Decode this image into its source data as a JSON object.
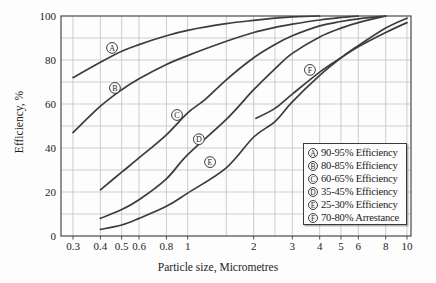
{
  "figure": {
    "kind": "filter-efficiency-chart"
  },
  "chart_data": {
    "type": "line",
    "title": "",
    "xlabel": "Particle size, Micrometres",
    "ylabel": "Efficiency, %",
    "x_scale": "log",
    "x_range": [
      0.3,
      10
    ],
    "ylim": [
      0,
      100
    ],
    "grid": true,
    "x_ticks": {
      "values": [
        0.3,
        0.4,
        0.5,
        0.6,
        0.8,
        1,
        2,
        3,
        4,
        5,
        6,
        8,
        10
      ],
      "labels": [
        "0.3",
        "0.4",
        "0.5",
        "0.6",
        "0.8",
        "1",
        "2",
        "3",
        "4",
        "5",
        "6",
        "8",
        "10"
      ]
    },
    "x_minor_gridlines": [
      1.5,
      2.5
    ],
    "y_ticks": {
      "values": [
        0,
        20,
        40,
        60,
        80,
        100
      ],
      "labels": [
        "0",
        "20",
        "40",
        "60",
        "80",
        "100"
      ]
    },
    "y_grid_step": 10,
    "line_color": "#3c3c3c",
    "grid_color": "#c0c0c0",
    "frame_color": "#4a4a4a",
    "series": [
      {
        "name": "A",
        "legend": "90-95% Efficiency",
        "points": [
          [
            0.3,
            72
          ],
          [
            0.4,
            79
          ],
          [
            0.5,
            84
          ],
          [
            0.6,
            87
          ],
          [
            0.8,
            91
          ],
          [
            1,
            93.5
          ],
          [
            1.5,
            96.5
          ],
          [
            2,
            98
          ],
          [
            2.5,
            99
          ],
          [
            3,
            99.6
          ],
          [
            4,
            100
          ]
        ]
      },
      {
        "name": "B",
        "legend": "80-85% Efficiency",
        "points": [
          [
            0.3,
            47
          ],
          [
            0.4,
            59
          ],
          [
            0.5,
            66.5
          ],
          [
            0.6,
            71.5
          ],
          [
            0.8,
            78
          ],
          [
            1,
            82
          ],
          [
            1.5,
            88.5
          ],
          [
            2,
            92.5
          ],
          [
            2.5,
            94.8
          ],
          [
            3,
            96.3
          ],
          [
            4,
            98.2
          ],
          [
            5,
            99.3
          ],
          [
            6,
            100
          ]
        ]
      },
      {
        "name": "C",
        "legend": "60-65% Efficiency",
        "points": [
          [
            0.4,
            21
          ],
          [
            0.5,
            29
          ],
          [
            0.6,
            35.5
          ],
          [
            0.8,
            46
          ],
          [
            1,
            56
          ],
          [
            1.2,
            62
          ],
          [
            1.5,
            71
          ],
          [
            2,
            81
          ],
          [
            2.5,
            87
          ],
          [
            3,
            91
          ],
          [
            4,
            95.5
          ],
          [
            5,
            97.5
          ],
          [
            6,
            98.7
          ],
          [
            8,
            100
          ]
        ]
      },
      {
        "name": "D",
        "legend": "35-45% Efficiency",
        "points": [
          [
            0.4,
            8
          ],
          [
            0.5,
            12
          ],
          [
            0.6,
            16.5
          ],
          [
            0.8,
            26
          ],
          [
            1,
            37
          ],
          [
            1.5,
            53
          ],
          [
            2,
            66.5
          ],
          [
            2.5,
            76
          ],
          [
            3,
            83
          ],
          [
            4,
            90.5
          ],
          [
            5,
            94.5
          ],
          [
            6,
            97
          ],
          [
            8,
            100
          ]
        ]
      },
      {
        "name": "E",
        "legend": "25-30% Efficiency",
        "points": [
          [
            0.4,
            3
          ],
          [
            0.5,
            5
          ],
          [
            0.6,
            8
          ],
          [
            0.8,
            13.5
          ],
          [
            1,
            19.5
          ],
          [
            1.5,
            31
          ],
          [
            2,
            45
          ],
          [
            2.5,
            52
          ],
          [
            3,
            61
          ],
          [
            4,
            73
          ],
          [
            5,
            81
          ],
          [
            6,
            86.5
          ],
          [
            8,
            94.5
          ],
          [
            10,
            99
          ]
        ]
      },
      {
        "name": "F",
        "legend": "70-80% Arrestance",
        "points": [
          [
            2.05,
            53.5
          ],
          [
            2.5,
            58
          ],
          [
            3,
            64.5
          ],
          [
            4,
            74.5
          ],
          [
            5,
            81
          ],
          [
            6,
            86
          ],
          [
            8,
            92.5
          ],
          [
            10,
            97
          ]
        ]
      }
    ],
    "annotations": [
      {
        "letter": "A",
        "size": 0.452,
        "pct": 85.5
      },
      {
        "letter": "B",
        "size": 0.466,
        "pct": 67.3
      },
      {
        "letter": "C",
        "size": 0.894,
        "pct": 55.0
      },
      {
        "letter": "D",
        "size": 1.125,
        "pct": 44.0
      },
      {
        "letter": "E",
        "size": 1.265,
        "pct": 33.6
      },
      {
        "letter": "F",
        "size": 3.61,
        "pct": 75.5
      }
    ],
    "legend_position": "inside-bottom-right"
  },
  "legend": {
    "items": [
      {
        "letter": "A",
        "text": "90-95% Efficiency"
      },
      {
        "letter": "B",
        "text": "80-85% Efficiency"
      },
      {
        "letter": "C",
        "text": "60-65% Efficiency"
      },
      {
        "letter": "D",
        "text": "35-45% Efficiency"
      },
      {
        "letter": "E",
        "text": "25-30% Efficiency"
      },
      {
        "letter": "F",
        "text": "70-80% Arrestance"
      }
    ]
  }
}
